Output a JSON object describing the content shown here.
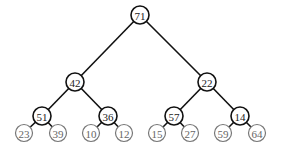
{
  "tree": {
    "nodes": [
      {
        "id": "n0",
        "label": "71",
        "x": 140,
        "y": 15,
        "leaf": false
      },
      {
        "id": "n1",
        "label": "42",
        "x": 75,
        "y": 82,
        "leaf": false
      },
      {
        "id": "n2",
        "label": "22",
        "x": 207,
        "y": 82,
        "leaf": false
      },
      {
        "id": "n3",
        "label": "51",
        "x": 42,
        "y": 116,
        "leaf": false
      },
      {
        "id": "n4",
        "label": "36",
        "x": 108,
        "y": 116,
        "leaf": false
      },
      {
        "id": "n5",
        "label": "57",
        "x": 174,
        "y": 116,
        "leaf": false
      },
      {
        "id": "n6",
        "label": "14",
        "x": 240,
        "y": 116,
        "leaf": false
      },
      {
        "id": "n7",
        "label": "23",
        "x": 24,
        "y": 133,
        "leaf": true
      },
      {
        "id": "n8",
        "label": "39",
        "x": 58,
        "y": 133,
        "leaf": true
      },
      {
        "id": "n9",
        "label": "10",
        "x": 91,
        "y": 133,
        "leaf": true
      },
      {
        "id": "n10",
        "label": "12",
        "x": 124,
        "y": 133,
        "leaf": true
      },
      {
        "id": "n11",
        "label": "15",
        "x": 157,
        "y": 133,
        "leaf": true
      },
      {
        "id": "n12",
        "label": "27",
        "x": 190,
        "y": 133,
        "leaf": true
      },
      {
        "id": "n13",
        "label": "59",
        "x": 223,
        "y": 133,
        "leaf": true
      },
      {
        "id": "n14",
        "label": "64",
        "x": 257,
        "y": 133,
        "leaf": true
      }
    ],
    "edges": [
      [
        "n0",
        "n1"
      ],
      [
        "n0",
        "n2"
      ],
      [
        "n1",
        "n3"
      ],
      [
        "n1",
        "n4"
      ],
      [
        "n2",
        "n5"
      ],
      [
        "n2",
        "n6"
      ],
      [
        "n3",
        "n7"
      ],
      [
        "n3",
        "n8"
      ],
      [
        "n4",
        "n9"
      ],
      [
        "n4",
        "n10"
      ],
      [
        "n5",
        "n11"
      ],
      [
        "n5",
        "n12"
      ],
      [
        "n6",
        "n13"
      ],
      [
        "n6",
        "n14"
      ]
    ]
  }
}
